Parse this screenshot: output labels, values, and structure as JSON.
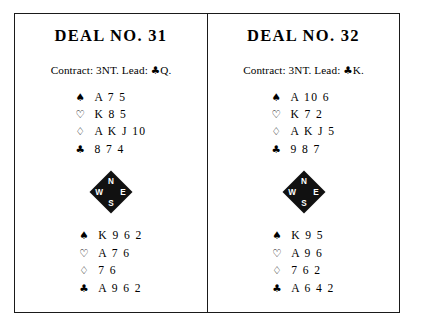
{
  "page": {
    "background_color": "#ffffff",
    "ink_color": "#000000",
    "border_color": "#1a1a1a"
  },
  "symbols": {
    "spade": "♠",
    "heart": "♡",
    "diamond": "♢",
    "club": "♣"
  },
  "compass": {
    "north": "N",
    "west": "W",
    "east": "E",
    "south": "S"
  },
  "deals": [
    {
      "title": "DEAL NO. 31",
      "contract_prefix": "Contract: 3NT. Lead: ",
      "lead_suit": "♣",
      "lead_rank": "Q.",
      "north": {
        "spades_sym": "♠",
        "spades": "A 7 5",
        "hearts_sym": "♡",
        "hearts": "K 8 5",
        "diamonds_sym": "♢",
        "diamonds": "A K J 10",
        "clubs_sym": "♣",
        "clubs": "8 7 4"
      },
      "south": {
        "spades_sym": "♠",
        "spades": "K 9 6 2",
        "hearts_sym": "♡",
        "hearts": "A 7 6",
        "diamonds_sym": "♢",
        "diamonds": "7 6",
        "clubs_sym": "♣",
        "clubs": "A 9 6 2"
      }
    },
    {
      "title": "DEAL NO. 32",
      "contract_prefix": "Contract: 3NT. Lead: ",
      "lead_suit": "♣",
      "lead_rank": "K.",
      "north": {
        "spades_sym": "♠",
        "spades": "A 10 6",
        "hearts_sym": "♡",
        "hearts": "K 7 2",
        "diamonds_sym": "♢",
        "diamonds": "A K J 5",
        "clubs_sym": "♣",
        "clubs": "9 8 7"
      },
      "south": {
        "spades_sym": "♠",
        "spades": "K 9 5",
        "hearts_sym": "♡",
        "hearts": "A 9 6",
        "diamonds_sym": "♢",
        "diamonds": "7 6 2",
        "clubs_sym": "♣",
        "clubs": "A 6 4 2"
      }
    }
  ]
}
